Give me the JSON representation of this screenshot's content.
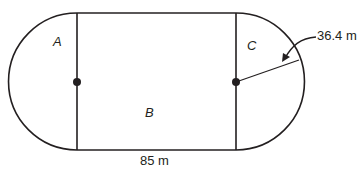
{
  "diagram": {
    "regions": [
      {
        "id": "A",
        "label": "A",
        "shape": "semicircle-left"
      },
      {
        "id": "B",
        "label": "B",
        "shape": "rectangle"
      },
      {
        "id": "C",
        "label": "C",
        "shape": "semicircle-right"
      }
    ],
    "dimensions": {
      "length_label": "85 m",
      "radius_label": "36.4 m"
    },
    "colors": {
      "stroke": "#231f20",
      "background": "#ffffff"
    }
  }
}
